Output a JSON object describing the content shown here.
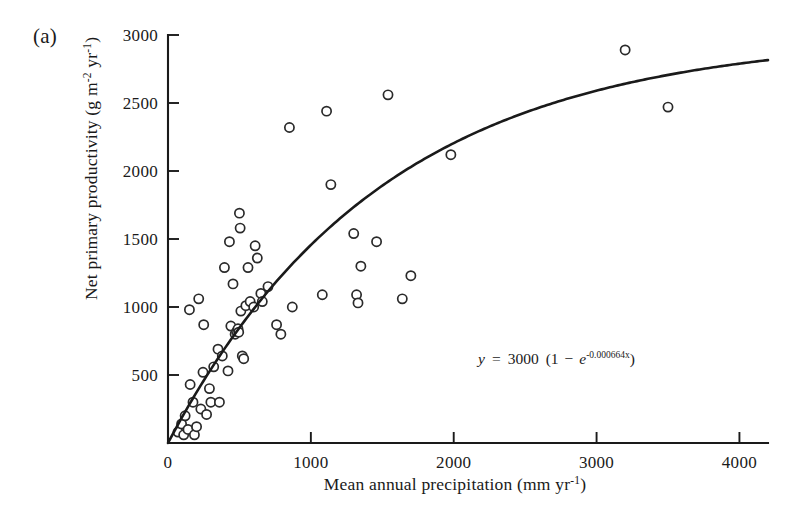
{
  "figure": {
    "panel_label": "(a)"
  },
  "chart_data": {
    "type": "scatter",
    "title": "",
    "xlabel": "Mean annual precipitation (mm yr⁻¹)",
    "ylabel": "Net primary productivity (g m⁻² yr⁻¹)",
    "xlabel_parts": {
      "main": "Mean annual precipitation (mm yr",
      "exponent": "-1",
      "tail": ")"
    },
    "ylabel_parts": {
      "main": "Net primary productivity (g m",
      "exponent1": "-2",
      "mid": " yr",
      "exponent2": "-1",
      "tail": ")"
    },
    "xlim": [
      0,
      4200
    ],
    "ylim": [
      0,
      3000
    ],
    "xticks": [
      0,
      1000,
      2000,
      3000,
      4000
    ],
    "xtick_labels": [
      "0",
      "1000",
      "2000",
      "3000",
      "4000"
    ],
    "yticks": [
      500,
      1000,
      1500,
      2000,
      2500,
      3000
    ],
    "ytick_labels": [
      "500",
      "1000",
      "1500",
      "2000",
      "2500",
      "3000"
    ],
    "grid": false,
    "legend": "none",
    "marker": "open-circle",
    "marker_facecolor": "#ffffff",
    "marker_edgecolor": "#2a2a2a",
    "line_color": "#1a1a1a",
    "annotation": {
      "text": "y = 3000 (1 - e^-0.000664x)",
      "parts": {
        "y": "y",
        "equals": "=",
        "coefficient": "3000",
        "open": "(1",
        "minus": "−",
        "e": "e",
        "exponent": "-0.000664x",
        "close": ")"
      },
      "x": 2530,
      "y_value": 790
    },
    "fit": {
      "model": "asymptotic-exponential",
      "equation": "y = 3000 (1 - exp(-0.000664 x))",
      "asymptote": 3000,
      "rate": 0.000664,
      "x_start": 0,
      "x_end": 4200,
      "y_at_x_end": 2817
    },
    "series": [
      {
        "name": "sites",
        "n_points": 60,
        "points": [
          [
            70,
            80
          ],
          [
            95,
            140
          ],
          [
            110,
            60
          ],
          [
            120,
            200
          ],
          [
            140,
            100
          ],
          [
            150,
            980
          ],
          [
            155,
            430
          ],
          [
            175,
            300
          ],
          [
            185,
            60
          ],
          [
            200,
            120
          ],
          [
            215,
            1060
          ],
          [
            230,
            250
          ],
          [
            245,
            520
          ],
          [
            250,
            870
          ],
          [
            270,
            210
          ],
          [
            290,
            400
          ],
          [
            300,
            300
          ],
          [
            320,
            560
          ],
          [
            350,
            690
          ],
          [
            360,
            300
          ],
          [
            380,
            640
          ],
          [
            395,
            1290
          ],
          [
            420,
            530
          ],
          [
            430,
            1480
          ],
          [
            440,
            860
          ],
          [
            455,
            1170
          ],
          [
            470,
            800
          ],
          [
            480,
            820
          ],
          [
            490,
            840
          ],
          [
            495,
            815
          ],
          [
            500,
            1690
          ],
          [
            505,
            1580
          ],
          [
            510,
            970
          ],
          [
            520,
            640
          ],
          [
            530,
            620
          ],
          [
            545,
            1010
          ],
          [
            560,
            1290
          ],
          [
            575,
            1040
          ],
          [
            600,
            1000
          ],
          [
            610,
            1450
          ],
          [
            625,
            1360
          ],
          [
            650,
            1100
          ],
          [
            660,
            1040
          ],
          [
            700,
            1150
          ],
          [
            760,
            870
          ],
          [
            790,
            800
          ],
          [
            850,
            2320
          ],
          [
            870,
            1000
          ],
          [
            1080,
            1090
          ],
          [
            1110,
            2440
          ],
          [
            1140,
            1900
          ],
          [
            1300,
            1540
          ],
          [
            1320,
            1090
          ],
          [
            1330,
            1030
          ],
          [
            1350,
            1300
          ],
          [
            1460,
            1480
          ],
          [
            1540,
            2560
          ],
          [
            1640,
            1060
          ],
          [
            1700,
            1230
          ],
          [
            1980,
            2120
          ],
          [
            3200,
            2890
          ],
          [
            3500,
            2470
          ]
        ]
      }
    ]
  }
}
